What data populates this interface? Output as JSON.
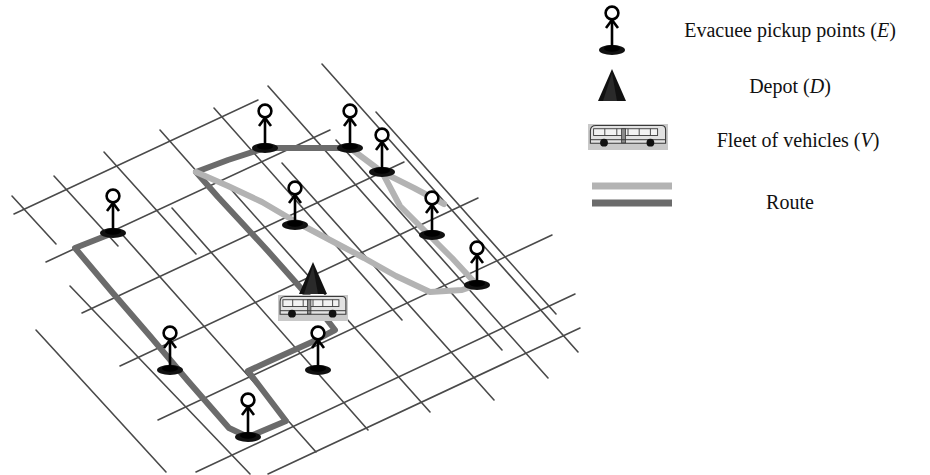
{
  "figure": {
    "kind": "schematic-diagram",
    "background_color": "#ffffff"
  },
  "colors": {
    "grid_line": "#4a4a4a",
    "route_light": "#b3b3b3",
    "route_dark": "#6b6b6b",
    "marker_fill": "#111111",
    "bus_body": "#c9c9c9",
    "bus_outline": "#3a3a3a",
    "text": "#111111"
  },
  "legend": {
    "title": "",
    "items": [
      {
        "id": "evacuee",
        "icon": "stick-figure-icon",
        "label_plain": "Evacuee pickup points (E)",
        "label_main": "Evacuee pickup points (",
        "label_symbol": "E",
        "label_tail": ")",
        "symbol": "E",
        "icon_x": 612,
        "icon_y": 30,
        "text_x": 790,
        "text_y": 30
      },
      {
        "id": "depot",
        "icon": "triangle-depot-icon",
        "label_plain": "Depot (D)",
        "label_main": "Depot (",
        "label_symbol": "D",
        "label_tail": ")",
        "symbol": "D",
        "icon_x": 612,
        "icon_y": 85,
        "text_x": 790,
        "text_y": 86
      },
      {
        "id": "fleet",
        "icon": "bus-icon",
        "label_plain": "Fleet of vehicles (V)",
        "label_main": "Fleet of vehicles (",
        "label_symbol": "V",
        "label_tail": ")",
        "symbol": "V",
        "icon_x": 628,
        "icon_y": 137,
        "text_x": 798,
        "text_y": 140
      },
      {
        "id": "route",
        "icon": "route-line-swatch-icon",
        "label_plain": "Route",
        "label_main": "Route",
        "label_symbol": "",
        "label_tail": "",
        "symbol": "",
        "icon_x": 632,
        "icon_y": 193,
        "text_x": 790,
        "text_y": 202
      }
    ],
    "route_swatches": [
      {
        "id": "route-swatch-light",
        "color_key": "route_light",
        "x1": 592,
        "y1": 186,
        "x2": 672,
        "y2": 186,
        "width": 7
      },
      {
        "id": "route-swatch-dark",
        "color_key": "route_dark",
        "x1": 592,
        "y1": 203,
        "x2": 672,
        "y2": 203,
        "width": 7
      }
    ]
  },
  "map": {
    "grid": {
      "description": "Oblique street grid of two crossing line families",
      "family_a_angle_deg": -25,
      "family_b_angle_deg": 42,
      "stroke_width": 1.6,
      "family_a": [
        {
          "x1": 14,
          "y1": 214,
          "x2": 258,
          "y2": 100
        },
        {
          "x1": 46,
          "y1": 262,
          "x2": 330,
          "y2": 130
        },
        {
          "x1": 82,
          "y1": 313,
          "x2": 404,
          "y2": 162
        },
        {
          "x1": 120,
          "y1": 366,
          "x2": 478,
          "y2": 198
        },
        {
          "x1": 158,
          "y1": 420,
          "x2": 552,
          "y2": 235
        },
        {
          "x1": 196,
          "y1": 472,
          "x2": 575,
          "y2": 294
        },
        {
          "x1": 268,
          "y1": 474,
          "x2": 580,
          "y2": 328
        }
      ],
      "family_b": [
        {
          "x1": 104,
          "y1": 152,
          "x2": 196,
          "y2": 254
        },
        {
          "x1": 160,
          "y1": 130,
          "x2": 300,
          "y2": 288
        },
        {
          "x1": 214,
          "y1": 108,
          "x2": 402,
          "y2": 320
        },
        {
          "x1": 268,
          "y1": 86,
          "x2": 502,
          "y2": 350
        },
        {
          "x1": 322,
          "y1": 64,
          "x2": 578,
          "y2": 352
        },
        {
          "x1": 54,
          "y1": 176,
          "x2": 118,
          "y2": 246
        },
        {
          "x1": 12,
          "y1": 196,
          "x2": 56,
          "y2": 244
        },
        {
          "x1": 376,
          "y1": 112,
          "x2": 556,
          "y2": 314
        },
        {
          "x1": 120,
          "y1": 232,
          "x2": 316,
          "y2": 452
        },
        {
          "x1": 70,
          "y1": 286,
          "x2": 250,
          "y2": 474
        },
        {
          "x1": 36,
          "y1": 330,
          "x2": 166,
          "y2": 472
        },
        {
          "x1": 172,
          "y1": 208,
          "x2": 368,
          "y2": 430
        },
        {
          "x1": 228,
          "y1": 186,
          "x2": 430,
          "y2": 412
        },
        {
          "x1": 282,
          "y1": 163,
          "x2": 494,
          "y2": 400
        },
        {
          "x1": 336,
          "y1": 140,
          "x2": 548,
          "y2": 378
        }
      ]
    },
    "routes": [
      {
        "id": "route-dark-loop",
        "color_key": "route_dark",
        "stroke_width": 6,
        "label": "Route (dark)",
        "points": "113,233 75,248 112,292 150,336 188,381 229,428 248,437 286,421 248,371 272,360 312,342 335,330 314,303 291,277 267,250 243,224 218,197 196,172 228,160 265,148 306,148 350,148"
      },
      {
        "id": "route-light-branch",
        "color_key": "route_light",
        "stroke_width": 6,
        "label": "Route (light)",
        "points": "196,172 228,186 262,202 296,222 330,240 364,258 396,276 430,292 462,290 477,285 452,258 426,232 400,206 382,172 350,148"
      },
      {
        "id": "route-light-tail",
        "color_key": "route_light",
        "stroke_width": 6,
        "label": "Route (light connector)",
        "points": "382,172 414,188 444,204"
      }
    ],
    "pickup_points": [
      {
        "id": "pickup-1",
        "x": 113,
        "y": 233,
        "label": "E1"
      },
      {
        "id": "pickup-2",
        "x": 265,
        "y": 148,
        "label": "E2"
      },
      {
        "id": "pickup-3",
        "x": 350,
        "y": 148,
        "label": "E3"
      },
      {
        "id": "pickup-4",
        "x": 382,
        "y": 172,
        "label": "E4"
      },
      {
        "id": "pickup-5",
        "x": 432,
        "y": 235,
        "label": "E5"
      },
      {
        "id": "pickup-6",
        "x": 477,
        "y": 285,
        "label": "E6"
      },
      {
        "id": "pickup-7",
        "x": 295,
        "y": 225,
        "label": "E7"
      },
      {
        "id": "pickup-8",
        "x": 170,
        "y": 370,
        "label": "E8"
      },
      {
        "id": "pickup-9",
        "x": 318,
        "y": 370,
        "label": "E9"
      },
      {
        "id": "pickup-10",
        "x": 248,
        "y": 437,
        "label": "E10"
      }
    ],
    "depot": {
      "id": "depot-marker",
      "x": 313,
      "y": 288,
      "label": "D"
    },
    "vehicle": {
      "id": "bus-marker",
      "x": 278,
      "y": 295,
      "width": 70,
      "height": 26,
      "label": "V"
    }
  }
}
